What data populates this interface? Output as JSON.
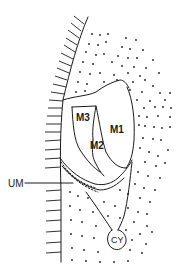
{
  "figure": {
    "type": "anatomical line drawing",
    "colors": {
      "ink": "#1a1a1a",
      "background": "#ffffff"
    },
    "labels": {
      "m1": "M1",
      "m2": "M2",
      "m3": "M3",
      "um": "UM",
      "cy": "CY"
    }
  }
}
